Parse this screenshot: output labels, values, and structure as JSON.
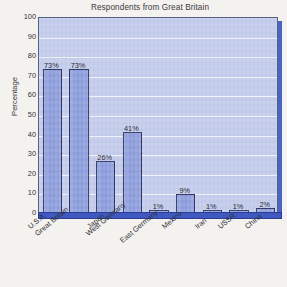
{
  "chart_data": {
    "type": "bar",
    "title": "Respondents from Great Britain",
    "xlabel": "",
    "ylabel": "Percentage",
    "ylim": [
      0,
      100
    ],
    "ytick_step": 10,
    "yticks": [
      100,
      90,
      80,
      70,
      60,
      50,
      40,
      30,
      20,
      10,
      0
    ],
    "grid": true,
    "legend": false,
    "legend_position": "none",
    "value_suffix": "%",
    "categories": [
      "U.S.A.",
      "Great Britain",
      "Japan",
      "West Germany",
      "East Germany",
      "Mexico",
      "Iran",
      "USSR",
      "China"
    ],
    "values": [
      73,
      73,
      26,
      41,
      1,
      9,
      1,
      1,
      2
    ],
    "data_labels": [
      "73%",
      "73%",
      "26%",
      "41%",
      "1%",
      "9%",
      "1%",
      "1%",
      "2%"
    ],
    "colors": {
      "bar_fill": "#8a9bdd",
      "bar_border": "#2f3560",
      "plot_background": "#c4cdec",
      "gridline": "#f2f4fb",
      "axis_base": "#3f59c0",
      "plot_shadow": "#4a63c4",
      "page_background": "#f4f2ee",
      "text": "#2f2f38"
    }
  }
}
